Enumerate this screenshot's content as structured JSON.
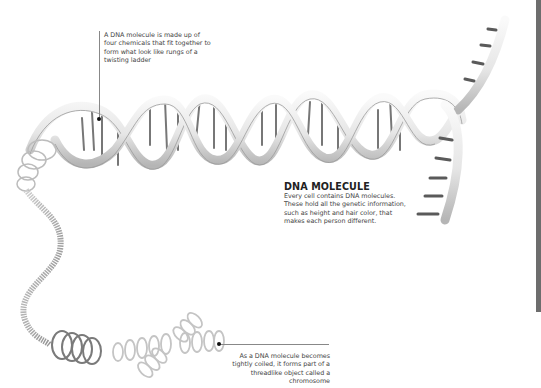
{
  "figure": {
    "title": "DNA MOLECULE",
    "description": "Every cell contains DNA molecules. These hold all the genetic information, such as height and hair color, that makes each person different.",
    "callouts": [
      {
        "id": "rungs",
        "text": "A DNA molecule is made up of four chemicals that fit together to form what look like rungs of a twisting ladder"
      },
      {
        "id": "chromosome",
        "text": "As a DNA molecule becomes tightly coiled, it forms part of a threadlike object called a chromosome"
      }
    ]
  },
  "colors": {
    "background": "#ffffff",
    "ribbon_light": "#f2f2f2",
    "ribbon_shade": "#b8b8b8",
    "rung_dark": "#5a5a5a",
    "side_bar": "#6d6d6d",
    "text": "#444444"
  }
}
